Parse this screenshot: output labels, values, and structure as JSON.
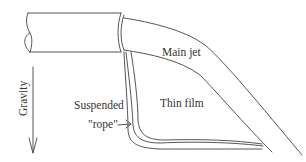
{
  "diagram": {
    "labels": {
      "main_jet": "Main jet",
      "thin_film": "Thin film",
      "suspended": "Suspended",
      "rope": "\"rope\"",
      "gravity": "Gravity"
    },
    "colors": {
      "line": "#555555",
      "text": "#333333",
      "background": "#ffffff"
    }
  }
}
